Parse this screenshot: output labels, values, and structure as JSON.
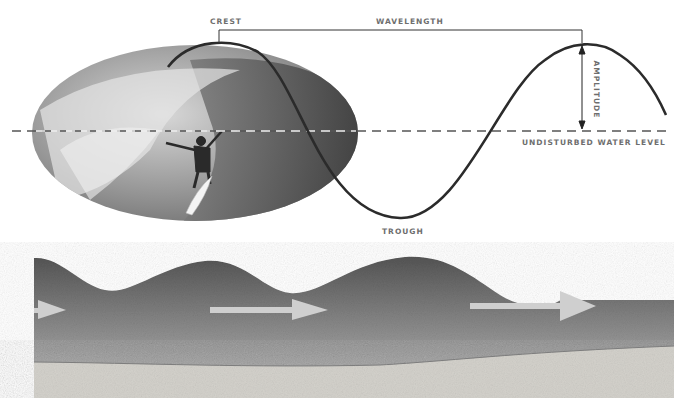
{
  "diagram": {
    "labels": {
      "crest": "CREST",
      "wavelength": "WAVELENGTH",
      "amplitude": "AMPLITUDE",
      "undisturbed_water_level": "UNDISTURBED WATER LEVEL",
      "trough": "TROUGH"
    },
    "photo": {
      "subject": "surfer riding inside a breaking wave barrel",
      "shape": "ellipse",
      "style": "grayscale"
    },
    "lower_panel": {
      "subject": "cross-section of ocean waves over sandy seabed",
      "arrows": 3,
      "arrow_direction": "right"
    },
    "colors": {
      "wave_line": "#2b2b2b",
      "label_text": "#6e6e6e",
      "water_top": "#5a5a5a",
      "water_bottom": "#b4b4b4",
      "sand": "#d6d4d0",
      "arrow": "#cfcfcf"
    }
  }
}
